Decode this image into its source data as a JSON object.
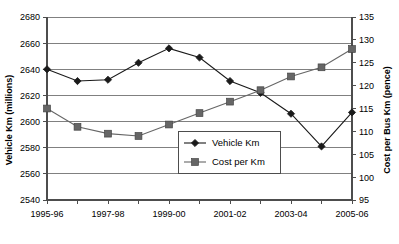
{
  "chart_data": {
    "type": "line",
    "title": "",
    "subtitle": "",
    "xlabel": "",
    "ylabel": "Vehicle Km (millions)",
    "y2label": "Cost per Bus Km (pence)",
    "grid": true,
    "legend_position": "inside-center-right",
    "categories": [
      "1995-96",
      "1996-97",
      "1997-98",
      "1998-99",
      "1999-00",
      "2000-01",
      "2001-02",
      "2002-03",
      "2003-04",
      "2004-05",
      "2005-06"
    ],
    "tick_labels_shown": [
      "1995-96",
      "1997-98",
      "1999-00",
      "2001-02",
      "2003-04",
      "2005-06"
    ],
    "ylim": [
      2540,
      2680
    ],
    "yticks": [
      2540,
      2560,
      2580,
      2600,
      2620,
      2640,
      2660,
      2680
    ],
    "y2lim": [
      95,
      135
    ],
    "y2ticks": [
      95,
      100,
      105,
      110,
      115,
      120,
      125,
      130,
      135
    ],
    "series": [
      {
        "name": "Vehicle Km",
        "axis": "left",
        "marker": "diamond",
        "color": "#1a1a1a",
        "values": [
          2640,
          2631,
          2632,
          2645,
          2656,
          2649,
          2631,
          2622,
          2606,
          2581,
          2607
        ]
      },
      {
        "name": "Cost per Km",
        "axis": "right",
        "marker": "square",
        "color": "#666666",
        "values": [
          115.0,
          111.0,
          109.5,
          109.0,
          111.5,
          114.0,
          116.5,
          119.0,
          122.0,
          124.0,
          128.0
        ]
      }
    ],
    "legend": [
      {
        "label": "Vehicle Km",
        "marker": "diamond",
        "color": "#1a1a1a"
      },
      {
        "label": "Cost per Km",
        "marker": "square",
        "color": "#666666"
      }
    ]
  }
}
